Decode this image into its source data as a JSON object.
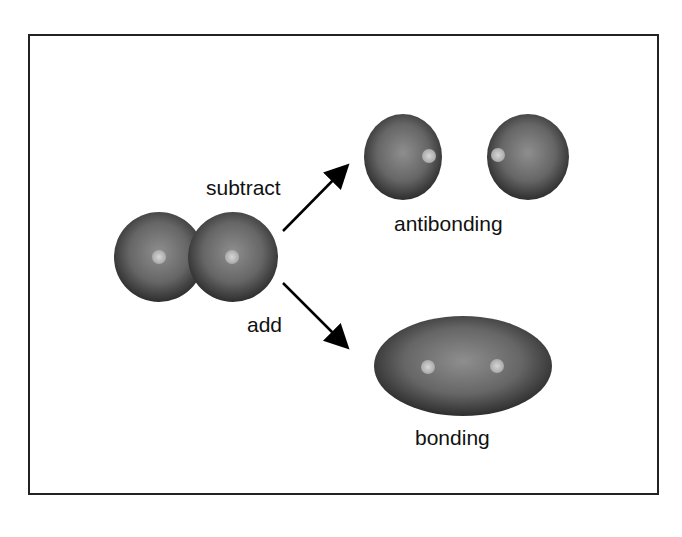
{
  "labels": {
    "subtract": "subtract",
    "add": "add",
    "antibonding": "antibonding",
    "bonding": "bonding"
  },
  "colors": {
    "orbital_edge": "#303030",
    "orbital_center": "#8a8a8a",
    "nucleus": "#c8c8c8",
    "frame": "#222222",
    "arrow": "#000000"
  }
}
